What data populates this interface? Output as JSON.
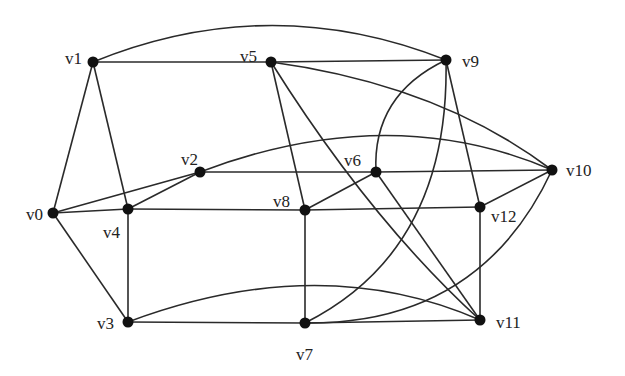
{
  "graph": {
    "type": "undirected",
    "nodes": [
      {
        "id": "v0",
        "label": "v0",
        "x": 53,
        "y": 213,
        "lx": 26,
        "ly": 220
      },
      {
        "id": "v1",
        "label": "v1",
        "x": 93,
        "y": 62,
        "lx": 65,
        "ly": 64
      },
      {
        "id": "v2",
        "label": "v2",
        "x": 200,
        "y": 172,
        "lx": 181,
        "ly": 165
      },
      {
        "id": "v3",
        "label": "v3",
        "x": 128,
        "y": 322,
        "lx": 97,
        "ly": 329
      },
      {
        "id": "v4",
        "label": "v4",
        "x": 128,
        "y": 209,
        "lx": 103,
        "ly": 238
      },
      {
        "id": "v5",
        "label": "v5",
        "x": 271,
        "y": 62,
        "lx": 240,
        "ly": 62
      },
      {
        "id": "v6",
        "label": "v6",
        "x": 376,
        "y": 172,
        "lx": 344,
        "ly": 166
      },
      {
        "id": "v7",
        "label": "v7",
        "x": 305,
        "y": 323,
        "lx": 296,
        "ly": 360
      },
      {
        "id": "v8",
        "label": "v8",
        "x": 305,
        "y": 210,
        "lx": 273,
        "ly": 207
      },
      {
        "id": "v9",
        "label": "v9",
        "x": 446,
        "y": 60,
        "lx": 462,
        "ly": 67
      },
      {
        "id": "v10",
        "label": "v10",
        "x": 552,
        "y": 170,
        "lx": 566,
        "ly": 176
      },
      {
        "id": "v11",
        "label": "v11",
        "x": 480,
        "y": 320,
        "lx": 496,
        "ly": 328
      },
      {
        "id": "v12",
        "label": "v12",
        "x": 480,
        "y": 207,
        "lx": 491,
        "ly": 222
      }
    ],
    "edges": [
      {
        "from": "v1",
        "to": "v5",
        "path": "M93,62 L271,62"
      },
      {
        "from": "v1",
        "to": "v9",
        "path": "M93,62 Q270,-10 446,60"
      },
      {
        "from": "v1",
        "to": "v0",
        "path": "M93,62 L53,213"
      },
      {
        "from": "v1",
        "to": "v4",
        "path": "M93,62 L128,209"
      },
      {
        "from": "v5",
        "to": "v9",
        "path": "M271,62 L446,60"
      },
      {
        "from": "v5",
        "to": "v8",
        "path": "M271,62 L305,210"
      },
      {
        "from": "v5",
        "to": "v11",
        "path": "M271,62 Q370,220 480,320"
      },
      {
        "from": "v5",
        "to": "v10",
        "path": "M271,62 Q440,85 552,170"
      },
      {
        "from": "v9",
        "to": "v6",
        "path": "M446,60 Q372,95 376,172"
      },
      {
        "from": "v9",
        "to": "v7",
        "path": "M446,60 Q450,250 305,323"
      },
      {
        "from": "v9",
        "to": "v12",
        "path": "M446,60 L480,207"
      },
      {
        "from": "v2",
        "to": "v0",
        "path": "M200,172 L53,213"
      },
      {
        "from": "v2",
        "to": "v4",
        "path": "M200,172 L128,209"
      },
      {
        "from": "v2",
        "to": "v6",
        "path": "M200,172 L376,172"
      },
      {
        "from": "v2",
        "to": "v10",
        "path": "M200,172 Q390,100 552,170"
      },
      {
        "from": "v6",
        "to": "v10",
        "path": "M376,172 L552,170"
      },
      {
        "from": "v6",
        "to": "v8",
        "path": "M376,172 L305,210"
      },
      {
        "from": "v6",
        "to": "v11",
        "path": "M376,172 L480,320"
      },
      {
        "from": "v10",
        "to": "v12",
        "path": "M552,170 L480,207"
      },
      {
        "from": "v10",
        "to": "v7",
        "path": "M552,170 Q480,325 305,323"
      },
      {
        "from": "v0",
        "to": "v4",
        "path": "M53,213 L128,209"
      },
      {
        "from": "v0",
        "to": "v3",
        "path": "M53,213 L128,322"
      },
      {
        "from": "v4",
        "to": "v8",
        "path": "M128,209 L305,210"
      },
      {
        "from": "v4",
        "to": "v3",
        "path": "M128,209 L128,322"
      },
      {
        "from": "v8",
        "to": "v12",
        "path": "M305,210 L480,207"
      },
      {
        "from": "v8",
        "to": "v7",
        "path": "M305,210 L305,323"
      },
      {
        "from": "v12",
        "to": "v11",
        "path": "M480,207 L480,320"
      },
      {
        "from": "v3",
        "to": "v7",
        "path": "M128,322 L305,323"
      },
      {
        "from": "v3",
        "to": "v11",
        "path": "M128,322 Q320,250 480,320"
      },
      {
        "from": "v7",
        "to": "v11",
        "path": "M305,323 L480,320"
      }
    ]
  }
}
